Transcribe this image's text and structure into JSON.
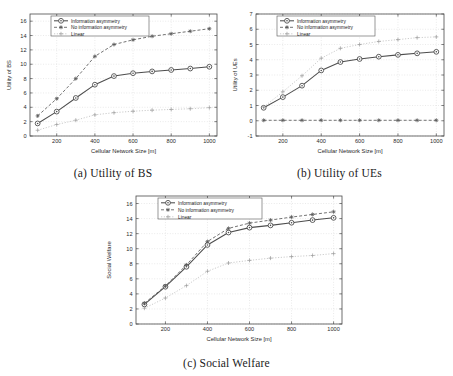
{
  "figure": {
    "subfigures": [
      {
        "id": "a",
        "caption": "(a) Utility of BS",
        "xlabel": "Cellular Network Size [m]",
        "ylabel": "Utility of BS"
      },
      {
        "id": "b",
        "caption": "(b) Utility of UEs",
        "xlabel": "Cellular Network Size [m]",
        "ylabel": "Utility of UEs"
      },
      {
        "id": "c",
        "caption": "(c) Social Welfare",
        "xlabel": "Cellular Network Size [m]",
        "ylabel": "Social Welfare"
      }
    ],
    "legend": [
      "Information asymmetry",
      "No information asymmetry",
      "Linear"
    ]
  },
  "chart_data": [
    {
      "type": "line",
      "id": "a",
      "title": "(a) Utility of BS",
      "xlabel": "Cellular Network Size [m]",
      "ylabel": "Utility of BS",
      "x": [
        100,
        200,
        300,
        400,
        500,
        600,
        700,
        800,
        900,
        1000
      ],
      "xlim": [
        60,
        1040
      ],
      "ylim": [
        0,
        17
      ],
      "xticks": [
        200,
        400,
        600,
        800,
        1000
      ],
      "yticks": [
        0,
        2,
        4,
        6,
        8,
        10,
        12,
        14,
        16
      ],
      "grid": true,
      "legend_position": "top-left",
      "series": [
        {
          "name": "Information asymmetry",
          "style": "solid",
          "marker": "circle",
          "values": [
            1.75,
            3.4,
            5.3,
            7.15,
            8.35,
            8.75,
            9.0,
            9.2,
            9.4,
            9.65
          ]
        },
        {
          "name": "No information asymmetry",
          "style": "dashed",
          "marker": "star",
          "values": [
            2.8,
            5.2,
            8.0,
            11.1,
            12.75,
            13.4,
            13.9,
            14.25,
            14.6,
            14.95
          ]
        },
        {
          "name": "Linear",
          "style": "dotted",
          "marker": "plus",
          "values": [
            0.8,
            1.6,
            2.2,
            2.95,
            3.25,
            3.45,
            3.6,
            3.7,
            3.8,
            3.95
          ]
        }
      ]
    },
    {
      "type": "line",
      "id": "b",
      "title": "(b) Utility of UEs",
      "xlabel": "Cellular Network Size [m]",
      "ylabel": "Utility of UEs",
      "x": [
        100,
        200,
        300,
        400,
        500,
        600,
        700,
        800,
        900,
        1000
      ],
      "xlim": [
        60,
        1040
      ],
      "ylim": [
        -1,
        7
      ],
      "xticks": [
        200,
        400,
        600,
        800,
        1000
      ],
      "yticks": [
        -1,
        0,
        1,
        2,
        3,
        4,
        5,
        6,
        7
      ],
      "grid": true,
      "legend_position": "top-left",
      "series": [
        {
          "name": "Information asymmetry",
          "style": "solid",
          "marker": "circle",
          "values": [
            0.85,
            1.55,
            2.3,
            3.3,
            3.85,
            4.05,
            4.2,
            4.32,
            4.42,
            4.52
          ]
        },
        {
          "name": "No information asymmetry",
          "style": "dashed",
          "marker": "star",
          "values": [
            0.03,
            0.03,
            0.03,
            0.03,
            0.03,
            0.03,
            0.03,
            0.03,
            0.03,
            0.03
          ]
        },
        {
          "name": "Linear",
          "style": "dotted",
          "marker": "plus",
          "values": [
            0.9,
            1.9,
            2.95,
            4.1,
            4.75,
            5.0,
            5.2,
            5.32,
            5.45,
            5.5
          ]
        }
      ]
    },
    {
      "type": "line",
      "id": "c",
      "title": "(c) Social Welfare",
      "xlabel": "Cellular Network Size [m]",
      "ylabel": "Social Welfare",
      "x": [
        100,
        200,
        300,
        400,
        500,
        600,
        700,
        800,
        900,
        1000
      ],
      "xlim": [
        60,
        1040
      ],
      "ylim": [
        0,
        17
      ],
      "xticks": [
        200,
        400,
        600,
        800,
        1000
      ],
      "yticks": [
        0,
        2,
        4,
        6,
        8,
        10,
        12,
        14,
        16
      ],
      "grid": true,
      "legend_position": "top-left",
      "series": [
        {
          "name": "Information asymmetry",
          "style": "solid",
          "marker": "circle",
          "values": [
            2.6,
            4.95,
            7.6,
            10.5,
            12.15,
            12.8,
            13.1,
            13.45,
            13.8,
            14.1
          ]
        },
        {
          "name": "No information asymmetry",
          "style": "dashed",
          "marker": "star",
          "values": [
            2.75,
            5.05,
            7.85,
            10.95,
            12.7,
            13.4,
            13.8,
            14.2,
            14.55,
            14.9
          ]
        },
        {
          "name": "Linear",
          "style": "dotted",
          "marker": "plus",
          "values": [
            2.1,
            3.45,
            5.1,
            7.0,
            8.1,
            8.45,
            8.75,
            8.95,
            9.1,
            9.35
          ]
        }
      ]
    }
  ]
}
